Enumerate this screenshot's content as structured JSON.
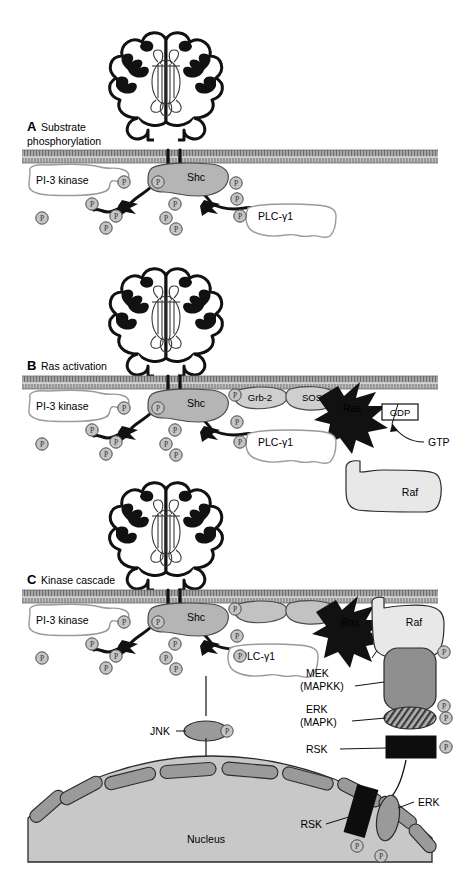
{
  "figure": {
    "width": 460,
    "height": 892,
    "phosphate_symbol": "P"
  },
  "colors": {
    "membrane_band": "#8a8a8a",
    "membrane_light": "#c9c9c9",
    "shc_fill": "#b5b5b5",
    "grb2_fill": "#cfcfcf",
    "sos_fill": "#cfcfcf",
    "ras_fill": "#111111",
    "raf_fill": "#e8e8e8",
    "mek_fill": "#8f8f8f",
    "erk_fill": "#9a9a9a",
    "rsk_fill": "#0d0d0d",
    "jnk_fill": "#9a9a9a",
    "nucleus_fill": "#c8c8c8",
    "nucleus_membrane": "#9a9a9a",
    "phosphate_fill": "#c4c4c4",
    "outline": "#222222",
    "pi3k_fill": "#ffffff",
    "plc_fill": "#ffffff"
  },
  "panels": [
    {
      "id": "A",
      "letter": "A",
      "title": "Substrate phosphorylation",
      "labels": {
        "pi3k": "PI-3 kinase",
        "shc": "Shc",
        "plc": "PLC-γ1"
      },
      "phosphate_count": 11
    },
    {
      "id": "B",
      "letter": "B",
      "title": "Ras activation",
      "labels": {
        "pi3k": "PI-3 kinase",
        "shc": "Shc",
        "plc": "PLC-γ1",
        "grb2": "Grb-2",
        "sos": "SOS",
        "ras": "Ras",
        "gdp": "GDP",
        "gtp": "GTP",
        "raf": "Raf"
      },
      "phosphate_count": 12
    },
    {
      "id": "C",
      "letter": "C",
      "title": "Kinase cascade",
      "labels": {
        "pi3k": "PI-3 kinase",
        "shc": "Shc",
        "plc": "PLC-γ1",
        "ras": "Ras",
        "gdp": "GDP",
        "raf": "Raf",
        "mek": "MEK",
        "mek_alt": "(MAPKK)",
        "erk": "ERK",
        "erk_alt": "(MAPK)",
        "rsk": "RSK",
        "jnk": "JNK",
        "nucleus": "Nucleus",
        "rsk_nuclear": "RSK",
        "erk_nuclear": "ERK"
      },
      "phosphate_count": 18
    }
  ]
}
